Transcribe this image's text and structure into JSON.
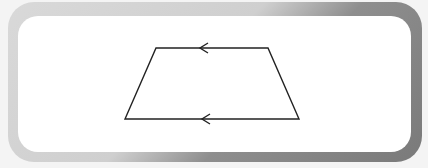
{
  "diagram": {
    "type": "trapezoid",
    "vertices": {
      "top_left": [
        156,
        48
      ],
      "top_right": [
        268,
        48
      ],
      "bottom_right": [
        299,
        119
      ],
      "bottom_left": [
        125,
        119
      ]
    },
    "parallel_marks": [
      {
        "edge": "top",
        "direction": "left",
        "position": [
          200,
          48
        ]
      },
      {
        "edge": "bottom",
        "direction": "left",
        "position": [
          202,
          119
        ]
      }
    ],
    "colors": {
      "stroke": "#222222",
      "panel": "#ffffff",
      "frame_light": "#d4d4d4",
      "frame_dark": "#7f7f7f"
    }
  }
}
